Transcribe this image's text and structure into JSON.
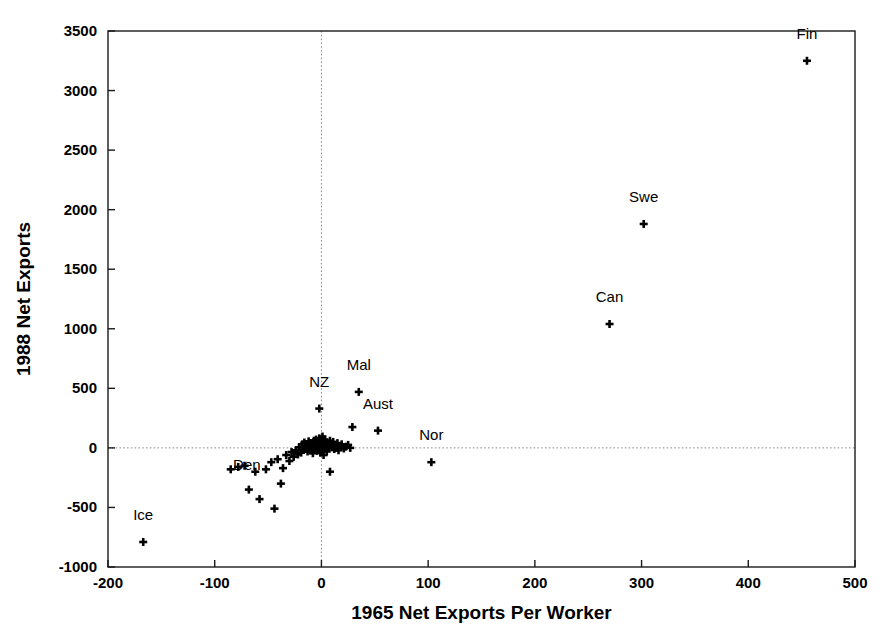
{
  "figure": {
    "background": "#ffffff",
    "ink_color": "#000000",
    "frame_color": "#1a1a1a",
    "gridline_color": "#8a8a8a"
  },
  "chart_data": {
    "type": "scatter",
    "title": "",
    "xlabel": "1965 Net Exports Per Worker",
    "ylabel": "1988 Net Exports",
    "xlim": [
      -200,
      500
    ],
    "ylim": [
      -1000,
      3500
    ],
    "xticks": [
      -200,
      -100,
      0,
      100,
      200,
      300,
      400,
      500
    ],
    "yticks": [
      -1000,
      -500,
      0,
      500,
      1000,
      1500,
      2000,
      2500,
      3000,
      3500
    ],
    "xtick_labels": [
      "-200",
      "-100",
      "0",
      "100",
      "200",
      "300",
      "400",
      "500"
    ],
    "ytick_labels": [
      "-1000",
      "-500",
      "0",
      "500",
      "1000",
      "1500",
      "2000",
      "2500",
      "3000",
      "3500"
    ],
    "grid": false,
    "zero_lines": {
      "x": 0,
      "y": 0,
      "style": "dotted"
    },
    "legend": "none",
    "marker": "plus",
    "labeled_points": [
      {
        "label": "Fin",
        "x": 455,
        "y": 3250,
        "label_dx": 0,
        "label_dy": -22
      },
      {
        "label": "Swe",
        "x": 302,
        "y": 1880,
        "label_dx": 0,
        "label_dy": -22
      },
      {
        "label": "Can",
        "x": 270,
        "y": 1040,
        "label_dx": 0,
        "label_dy": -22
      },
      {
        "label": "Mal",
        "x": 35,
        "y": 470,
        "label_dx": 0,
        "label_dy": -22
      },
      {
        "label": "NZ",
        "x": -2,
        "y": 330,
        "label_dx": 0,
        "label_dy": -22
      },
      {
        "label": "Aust",
        "x": 53,
        "y": 145,
        "label_dx": 0,
        "label_dy": -22
      },
      {
        "label": "Nor",
        "x": 103,
        "y": -120,
        "label_dx": 0,
        "label_dy": -22
      },
      {
        "label": "Den",
        "x": -68,
        "y": -350,
        "label_dx": -2,
        "label_dy": -20
      },
      {
        "label": "Ice",
        "x": -167,
        "y": -790,
        "label_dx": 0,
        "label_dy": -22
      }
    ],
    "unlabeled_points": [
      {
        "x": -58,
        "y": -430
      },
      {
        "x": -44,
        "y": -510
      },
      {
        "x": -38,
        "y": -300
      },
      {
        "x": -62,
        "y": -200
      },
      {
        "x": -72,
        "y": -150
      },
      {
        "x": -52,
        "y": -180
      },
      {
        "x": -47,
        "y": -120
      },
      {
        "x": -41,
        "y": -95
      },
      {
        "x": -36,
        "y": -170
      },
      {
        "x": -33,
        "y": -60
      },
      {
        "x": -30,
        "y": -110
      },
      {
        "x": -28,
        "y": -35
      },
      {
        "x": -26,
        "y": -75
      },
      {
        "x": -24,
        "y": -20
      },
      {
        "x": -22,
        "y": -55
      },
      {
        "x": -21,
        "y": 5
      },
      {
        "x": -19,
        "y": -40
      },
      {
        "x": -18,
        "y": 30
      },
      {
        "x": -17,
        "y": -15
      },
      {
        "x": -16,
        "y": 45
      },
      {
        "x": -15,
        "y": -5
      },
      {
        "x": -14,
        "y": 20
      },
      {
        "x": -13,
        "y": -30
      },
      {
        "x": -12,
        "y": 55
      },
      {
        "x": -11,
        "y": 10
      },
      {
        "x": -10,
        "y": -20
      },
      {
        "x": -10,
        "y": 40
      },
      {
        "x": -9,
        "y": 0
      },
      {
        "x": -8,
        "y": 25
      },
      {
        "x": -8,
        "y": -45
      },
      {
        "x": -7,
        "y": 60
      },
      {
        "x": -6,
        "y": 15
      },
      {
        "x": -6,
        "y": -10
      },
      {
        "x": -5,
        "y": 35
      },
      {
        "x": -5,
        "y": 70
      },
      {
        "x": -4,
        "y": 5
      },
      {
        "x": -4,
        "y": -25
      },
      {
        "x": -3,
        "y": 50
      },
      {
        "x": -3,
        "y": 20
      },
      {
        "x": -2,
        "y": -5
      },
      {
        "x": -2,
        "y": 80
      },
      {
        "x": -1,
        "y": 30
      },
      {
        "x": -1,
        "y": -40
      },
      {
        "x": 0,
        "y": 10
      },
      {
        "x": 0,
        "y": 55
      },
      {
        "x": 1,
        "y": -15
      },
      {
        "x": 1,
        "y": 95
      },
      {
        "x": 2,
        "y": 35
      },
      {
        "x": 2,
        "y": -60
      },
      {
        "x": 3,
        "y": 15
      },
      {
        "x": 3,
        "y": 70
      },
      {
        "x": 4,
        "y": -5
      },
      {
        "x": 5,
        "y": 45
      },
      {
        "x": 5,
        "y": -30
      },
      {
        "x": 6,
        "y": 25
      },
      {
        "x": 7,
        "y": 0
      },
      {
        "x": 8,
        "y": 60
      },
      {
        "x": 8,
        "y": -200
      },
      {
        "x": 9,
        "y": 30
      },
      {
        "x": 10,
        "y": 5
      },
      {
        "x": 11,
        "y": 50
      },
      {
        "x": 12,
        "y": -10
      },
      {
        "x": 13,
        "y": 25
      },
      {
        "x": 14,
        "y": 0
      },
      {
        "x": 15,
        "y": 40
      },
      {
        "x": 16,
        "y": -20
      },
      {
        "x": 17,
        "y": 15
      },
      {
        "x": 19,
        "y": 30
      },
      {
        "x": 21,
        "y": -5
      },
      {
        "x": 23,
        "y": 10
      },
      {
        "x": 25,
        "y": 25
      },
      {
        "x": 27,
        "y": 0
      },
      {
        "x": 29,
        "y": 175
      },
      {
        "x": -78,
        "y": -160
      },
      {
        "x": -85,
        "y": -180
      }
    ],
    "n_points_total": 84
  },
  "axes": {
    "x_title": "1965 Net Exports Per Worker",
    "y_title": "1988 Net Exports"
  }
}
